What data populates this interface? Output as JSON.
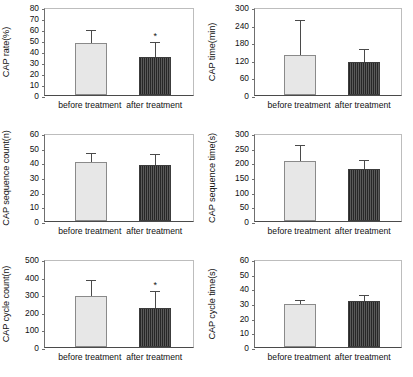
{
  "figure": {
    "significance_marker": "*",
    "colors": {
      "before_bar_fill": "#e7e7e7",
      "after_bar_fill": "#5a5a5a",
      "axis": "#4a4a4a",
      "background": "#ffffff"
    },
    "group_labels": [
      "before treatment",
      "after treatment"
    ]
  },
  "chart_data": [
    {
      "type": "bar",
      "panel": "(A)",
      "title": "",
      "xlabel": "",
      "ylabel": "CAP rate(%)",
      "ylim": [
        0,
        80
      ],
      "yticks": [
        0,
        10,
        20,
        30,
        40,
        50,
        60,
        70,
        80
      ],
      "ticklabels": [
        "0",
        "10",
        "20",
        "30",
        "40",
        "50",
        "60",
        "70",
        "80"
      ],
      "grid": false,
      "legend": "none",
      "categories": [
        "before treatment",
        "after treatment"
      ],
      "values": [
        47,
        35
      ],
      "errors": [
        11,
        12
      ],
      "significance": [
        false,
        true
      ]
    },
    {
      "type": "bar",
      "panel": "(B)",
      "title": "",
      "xlabel": "",
      "ylabel": "CAP time(min)",
      "ylim": [
        0,
        300
      ],
      "yticks": [
        0,
        60,
        120,
        180,
        240,
        300
      ],
      "ticklabels": [
        "0",
        "60",
        "120",
        "180",
        "240",
        "300"
      ],
      "grid": false,
      "legend": "none",
      "categories": [
        "before treatment",
        "after treatment"
      ],
      "values": [
        135,
        112
      ],
      "errors": [
        117,
        40
      ],
      "significance": [
        false,
        false
      ]
    },
    {
      "type": "bar",
      "panel": "(C)",
      "title": "",
      "xlabel": "",
      "ylabel": "CAP sequence count(n)",
      "ylim": [
        0,
        60
      ],
      "yticks": [
        0,
        10,
        20,
        30,
        40,
        50,
        60
      ],
      "ticklabels": [
        "0",
        "10",
        "20",
        "30",
        "40",
        "50",
        "60"
      ],
      "grid": false,
      "legend": "none",
      "categories": [
        "before treatment",
        "after treatment"
      ],
      "values": [
        40.5,
        38
      ],
      "errors": [
        5.5,
        7
      ],
      "significance": [
        false,
        false
      ]
    },
    {
      "type": "bar",
      "panel": "(D)",
      "title": "",
      "xlabel": "",
      "ylabel": "CAP sequence time(s)",
      "ylim": [
        0,
        300
      ],
      "yticks": [
        0,
        50,
        100,
        150,
        200,
        250,
        300
      ],
      "ticklabels": [
        "0",
        "50",
        "100",
        "150",
        "200",
        "250",
        "300"
      ],
      "grid": false,
      "legend": "none",
      "categories": [
        "before treatment",
        "after treatment"
      ],
      "values": [
        204,
        176
      ],
      "errors": [
        52,
        30
      ],
      "significance": [
        false,
        false
      ]
    },
    {
      "type": "bar",
      "panel": "(E)",
      "title": "",
      "xlabel": "",
      "ylabel": "CAP cycle count(n)",
      "ylim": [
        0,
        500
      ],
      "yticks": [
        0,
        100,
        200,
        300,
        400,
        500
      ],
      "ticklabels": [
        "0",
        "100",
        "200",
        "300",
        "400",
        "500"
      ],
      "grid": false,
      "legend": "none",
      "categories": [
        "before treatment",
        "after treatment"
      ],
      "values": [
        292,
        219
      ],
      "errors": [
        85,
        96
      ],
      "significance": [
        false,
        true
      ]
    },
    {
      "type": "bar",
      "panel": "(F)",
      "title": "",
      "xlabel": "",
      "ylabel": "CAP cycle time(s)",
      "ylim": [
        0,
        60
      ],
      "yticks": [
        0,
        10,
        20,
        30,
        40,
        50,
        60
      ],
      "ticklabels": [
        "0",
        "10",
        "20",
        "30",
        "40",
        "50",
        "60"
      ],
      "grid": false,
      "legend": "none",
      "categories": [
        "before treatment",
        "after treatment"
      ],
      "values": [
        29,
        31.5
      ],
      "errors": [
        2.6,
        3
      ],
      "significance": [
        false,
        false
      ]
    }
  ]
}
